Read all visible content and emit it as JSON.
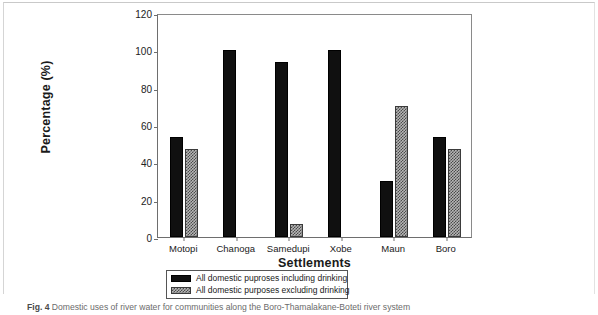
{
  "chart_data": {
    "type": "bar",
    "title": "",
    "xlabel": "Settlements",
    "ylabel": "Percentage (%)",
    "ylim": [
      0,
      120
    ],
    "yticks": [
      0,
      20,
      40,
      60,
      80,
      100,
      120
    ],
    "grid": false,
    "legend_position": "bottom",
    "categories": [
      "Motopi",
      "Chanoga",
      "Samedupi",
      "Xobe",
      "Maun",
      "Boro"
    ],
    "series": [
      {
        "name": "All domestic puproses including drinking",
        "pattern": "solid-black",
        "values": [
          53.5,
          100,
          93.5,
          100,
          30,
          53.5
        ]
      },
      {
        "name": "All domestic purposes excluding drinking",
        "pattern": "gray-crosshatch",
        "values": [
          47,
          0,
          7,
          0,
          70,
          47
        ]
      }
    ]
  },
  "caption": {
    "label": "Fig. 4",
    "text": "Domestic uses of river water for communities along the Boro-Thamalakane-Boteti river system"
  },
  "colors": {
    "series_solid": "#101010",
    "series_hatch_bg": "#b6b6b6",
    "series_hatch_fg": "#4a4a4a",
    "axis": "#6e6e6e",
    "caption_text": "#6b6b6b"
  }
}
